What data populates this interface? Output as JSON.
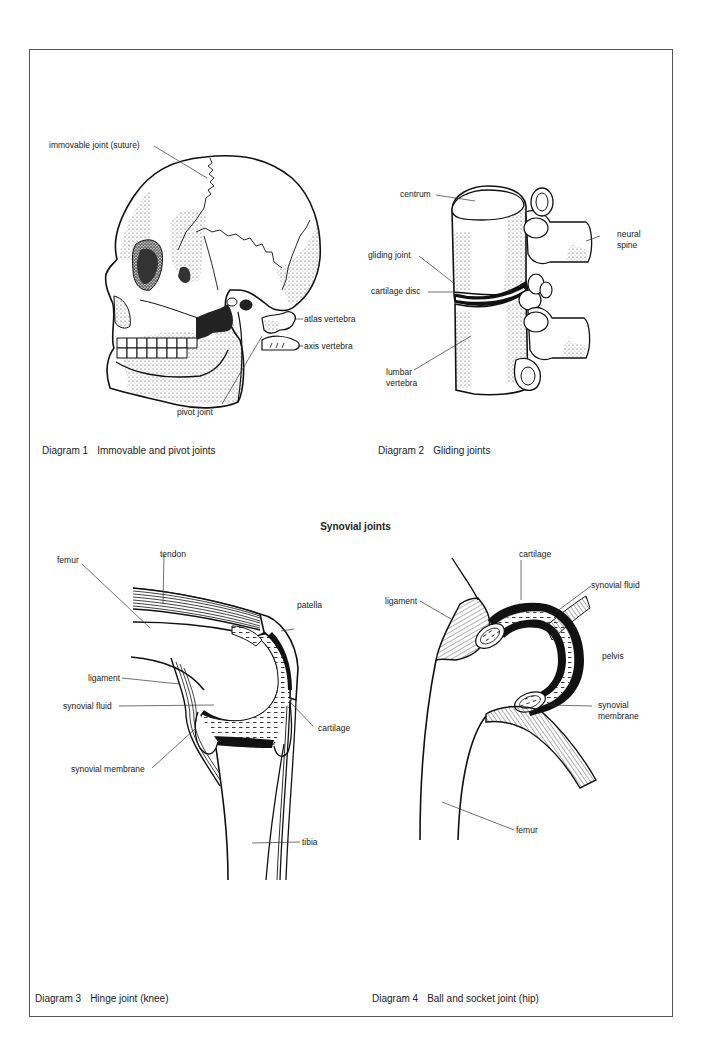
{
  "page": {
    "section_title": "Synovial joints"
  },
  "diagram1": {
    "number": "Diagram 1",
    "title": "Immovable and pivot joints",
    "labels": {
      "suture": "immovable joint (suture)",
      "atlas": "atlas vertebra",
      "axis": "axis vertebra",
      "pivot": "pivot joint"
    }
  },
  "diagram2": {
    "number": "Diagram 2",
    "title": "Gliding joints",
    "labels": {
      "centrum": "centrum",
      "neural_spine_1": "neural",
      "neural_spine_2": "spine",
      "gliding_joint": "gliding joint",
      "cartilage_disc": "cartilage disc",
      "lumbar_1": "lumbar",
      "lumbar_2": "vertebra"
    }
  },
  "diagram3": {
    "number": "Diagram 3",
    "title": "Hinge joint (knee)",
    "labels": {
      "femur": "femur",
      "tendon": "tendon",
      "patella": "patella",
      "ligament": "ligament",
      "synovial_fluid": "synovial fluid",
      "cartilage": "cartilage",
      "synovial_membrane": "synovial membrane",
      "tibia": "tibia"
    }
  },
  "diagram4": {
    "number": "Diagram 4",
    "title": "Ball and socket joint (hip)",
    "labels": {
      "cartilage": "cartilage",
      "ligament": "ligament",
      "synovial_fluid": "synovial fluid",
      "pelvis": "pelvis",
      "synovial_membrane_1": "synovial",
      "synovial_membrane_2": "membrane",
      "femur": "femur"
    }
  }
}
